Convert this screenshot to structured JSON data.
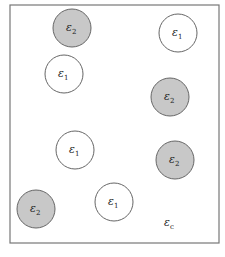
{
  "diagram": {
    "frame": {
      "x": 10,
      "y": 5,
      "width": 209,
      "height": 238,
      "stroke": "#777777"
    },
    "circle_radius": 19,
    "fill_colors": {
      "eps1": "#ffffff",
      "eps2": "#c8c8c8"
    },
    "stroke_color": "#666666",
    "circles": [
      {
        "label_base": "ε",
        "label_sub": "2",
        "cx": 72,
        "cy": 28,
        "type": "eps2"
      },
      {
        "label_base": "ε",
        "label_sub": "1",
        "cx": 178,
        "cy": 33,
        "type": "eps1"
      },
      {
        "label_base": "ε",
        "label_sub": "1",
        "cx": 64,
        "cy": 74,
        "type": "eps1"
      },
      {
        "label_base": "ε",
        "label_sub": "2",
        "cx": 170,
        "cy": 97,
        "type": "eps2"
      },
      {
        "label_base": "ε",
        "label_sub": "1",
        "cx": 75,
        "cy": 150,
        "type": "eps1"
      },
      {
        "label_base": "ε",
        "label_sub": "2",
        "cx": 175,
        "cy": 160,
        "type": "eps2"
      },
      {
        "label_base": "ε",
        "label_sub": "2",
        "cx": 36,
        "cy": 209,
        "type": "eps2"
      },
      {
        "label_base": "ε",
        "label_sub": "1",
        "cx": 114,
        "cy": 202,
        "type": "eps1"
      }
    ],
    "matrix_label": {
      "base": "ε",
      "sub": "c",
      "x": 164,
      "y": 226
    }
  }
}
